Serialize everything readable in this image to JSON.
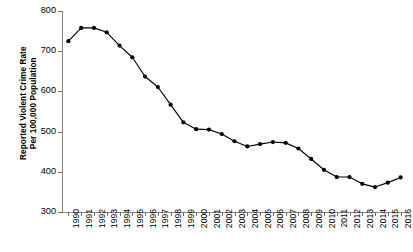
{
  "chart_data": {
    "type": "line",
    "title": "",
    "xlabel": "",
    "ylabel": "Reported Violent Crime Rate Per 100,000 Population",
    "ylabel_line1": "Reported Violent Crime Rate",
    "ylabel_line2": "Per 100,000 Population",
    "ylim": [
      300,
      800
    ],
    "ytick_values": [
      300,
      400,
      500,
      600,
      700,
      800
    ],
    "ytick_labels": [
      "300",
      "400",
      "500",
      "600",
      "700",
      "800"
    ],
    "grid": false,
    "legend": false,
    "legend_position": "none",
    "marker": "filled-circle",
    "line_color": "#000000",
    "marker_color": "#000000",
    "axis_color": "#8a8a8a",
    "categories": [
      "1990",
      "1991",
      "1992",
      "1993",
      "1994",
      "1995",
      "1996",
      "1997",
      "1998",
      "1999",
      "2000",
      "2001",
      "2002",
      "2003",
      "2004",
      "2005",
      "2006",
      "2007",
      "2008",
      "2009",
      "2010",
      "2011",
      "2012",
      "2013",
      "2014",
      "2015",
      "2016"
    ],
    "values": [
      725,
      758,
      758,
      747,
      714,
      685,
      637,
      611,
      567,
      523,
      506,
      505,
      494,
      476,
      463,
      469,
      474,
      472,
      458,
      432,
      405,
      387,
      387,
      370,
      362,
      373,
      386
    ],
    "series": [
      {
        "name": "Reported Violent Crime Rate Per 100,000 Population",
        "values": [
          725,
          758,
          758,
          747,
          714,
          685,
          637,
          611,
          567,
          523,
          506,
          505,
          494,
          476,
          463,
          469,
          474,
          472,
          458,
          432,
          405,
          387,
          387,
          370,
          362,
          373,
          386
        ]
      }
    ]
  }
}
